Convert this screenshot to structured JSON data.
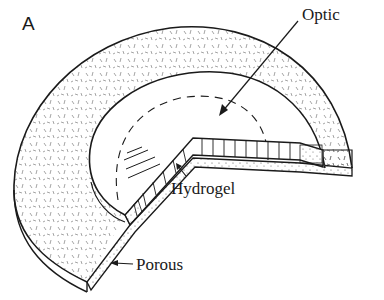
{
  "figure": {
    "panel_label": "A",
    "labels": {
      "optic": "Optic",
      "hydrogel": "Hydrogel",
      "porous": "Porous"
    },
    "colors": {
      "line": "#1a1a1a",
      "background": "#ffffff",
      "stipple": "#555555"
    }
  }
}
